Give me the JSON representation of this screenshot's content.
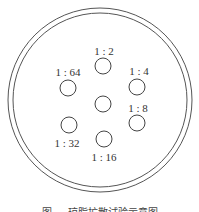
{
  "diagram": {
    "plate": {
      "cx": 100,
      "cy": 100,
      "outer_r": 92,
      "inner_r": 87,
      "stroke": "#555555"
    },
    "well_radius": 8,
    "center_well": {
      "cx": 103,
      "cy": 104
    },
    "wells": [
      {
        "label": "1 : 2",
        "cx": 103,
        "cy": 66,
        "lx": 104,
        "ly": 55
      },
      {
        "label": "1 : 4",
        "cx": 137,
        "cy": 87,
        "lx": 139,
        "ly": 75
      },
      {
        "label": "1 : 8",
        "cx": 137,
        "cy": 123,
        "lx": 138,
        "ly": 112
      },
      {
        "label": "1 : 16",
        "cx": 104,
        "cy": 139,
        "lx": 104,
        "ly": 161
      },
      {
        "label": "1 : 32",
        "cx": 69,
        "cy": 125,
        "lx": 67,
        "ly": 147
      },
      {
        "label": "1 : 64",
        "cx": 68,
        "cy": 88,
        "lx": 68,
        "ly": 76
      }
    ],
    "caption": "图 — 琼脂扩散试验示意图"
  }
}
